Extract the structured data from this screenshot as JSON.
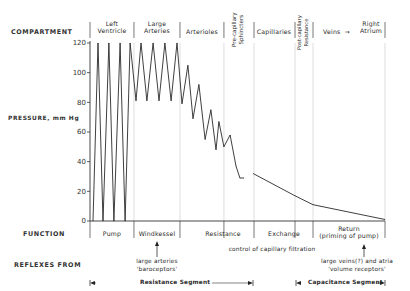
{
  "row_labels": {
    "compartment": "COMPARTMENT",
    "pressure": "PRESSURE, mm Hg",
    "function": "FUNCTION",
    "reflexes": "REFLEXES FROM"
  },
  "compartments": [
    {
      "line1": "Left",
      "line2": "Ventricle"
    },
    {
      "line1": "Large",
      "line2": "Arteries"
    },
    {
      "line1": "",
      "line2": "Arterioles"
    },
    {
      "line1": "Pre-capillary",
      "line2": "Sphincters"
    },
    {
      "line1": "",
      "line2": "Capillaries"
    },
    {
      "line1": "Post-capillary",
      "line2": "Resistance"
    },
    {
      "line1": "",
      "line2": "Veins"
    },
    {
      "line1": "Right",
      "line2": "Atrium"
    }
  ],
  "veins_arrow": "→",
  "functions": {
    "pump": "Pump",
    "windkessel": "Windkessel",
    "resistance": "Resistance",
    "exchange": "Exchange",
    "return_line1": "Return",
    "return_line2": "(priming of pump)"
  },
  "reflexes": {
    "baro_line1": "large arteries",
    "baro_line2": "'baroceptors'",
    "capillary": "control of capillary filtration",
    "volume_line1": "large veins(?) and atria",
    "volume_line2": "'volume receptors'"
  },
  "segments": {
    "resistance": "Resistance Segment",
    "capacitance": "Capacitance Segment"
  },
  "chart_data": {
    "type": "line",
    "title": "",
    "ylabel": "PRESSURE, mm Hg",
    "xlabel": "",
    "ylim": [
      0,
      120
    ],
    "yticks": [
      0,
      20,
      40,
      60,
      80,
      100,
      120
    ],
    "ytick_labels": [
      "0",
      "20",
      "40",
      "60",
      "80",
      "100",
      "120"
    ],
    "x_range": [
      0,
      100
    ],
    "compartment_boundaries": [
      0,
      14.9,
      30.5,
      45.4,
      55.6,
      69.5,
      75.6,
      100
    ],
    "series": [
      {
        "name": "Pressure",
        "x": [
          1.0,
          2.7,
          4.4,
          6.4,
          8.1,
          10.2,
          11.9,
          13.6,
          15.6,
          17.3,
          19.3,
          21.4,
          23.4,
          25.4,
          27.5,
          29.5,
          31.2,
          33.2,
          34.9,
          36.9,
          39.0,
          41.0,
          42.7,
          43.7,
          45.4,
          47.5,
          49.5,
          50.8,
          52.2
        ],
        "y": [
          0,
          120,
          0,
          120,
          0,
          120,
          0,
          120,
          81,
          120,
          81,
          120,
          81,
          120,
          81,
          120,
          79,
          105,
          69,
          92,
          55,
          75,
          48,
          67,
          50,
          58,
          37,
          29,
          29
        ]
      },
      {
        "name": "Pressure (continued)",
        "x": [
          55.3,
          69.5,
          75.6,
          100
        ],
        "y": [
          32,
          17,
          11,
          1
        ]
      }
    ]
  }
}
